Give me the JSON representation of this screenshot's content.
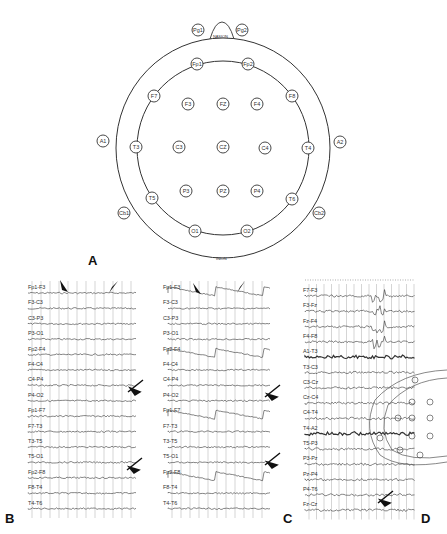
{
  "panel_a": {
    "label": "A",
    "nasion_label": "NASION",
    "inion_label": "INION",
    "electrodes": [
      {
        "name": "Pg1",
        "x": 198,
        "y": 30
      },
      {
        "name": "Pg2",
        "x": 242,
        "y": 30
      },
      {
        "name": "Fp1",
        "x": 197,
        "y": 64
      },
      {
        "name": "Fp2",
        "x": 248,
        "y": 64
      },
      {
        "name": "F7",
        "x": 154,
        "y": 96
      },
      {
        "name": "F3",
        "x": 188,
        "y": 104
      },
      {
        "name": "FZ",
        "x": 223,
        "y": 104
      },
      {
        "name": "F4",
        "x": 257,
        "y": 104
      },
      {
        "name": "F8",
        "x": 292,
        "y": 96
      },
      {
        "name": "A1",
        "x": 103,
        "y": 141
      },
      {
        "name": "T3",
        "x": 136,
        "y": 147
      },
      {
        "name": "C3",
        "x": 179,
        "y": 147
      },
      {
        "name": "CZ",
        "x": 223,
        "y": 147
      },
      {
        "name": "C4",
        "x": 265,
        "y": 148
      },
      {
        "name": "T4",
        "x": 308,
        "y": 148
      },
      {
        "name": "A2",
        "x": 340,
        "y": 142
      },
      {
        "name": "T5",
        "x": 152,
        "y": 198
      },
      {
        "name": "P3",
        "x": 186,
        "y": 191
      },
      {
        "name": "PZ",
        "x": 223,
        "y": 191
      },
      {
        "name": "P4",
        "x": 257,
        "y": 191
      },
      {
        "name": "T6",
        "x": 292,
        "y": 199
      },
      {
        "name": "Cb1",
        "x": 124,
        "y": 213
      },
      {
        "name": "Cb2",
        "x": 319,
        "y": 213
      },
      {
        "name": "O1",
        "x": 195,
        "y": 231
      },
      {
        "name": "O2",
        "x": 247,
        "y": 231
      }
    ]
  },
  "panel_b": {
    "label": "B",
    "channels": [
      "Fp1-F3",
      "F3-C3",
      "C3-P3",
      "P3-O1",
      "Fp2-F4",
      "F4-C4",
      "C4-P4",
      "P4-O2",
      "Fp1-F7",
      "F7-T3",
      "T3-T5",
      "T5-O1",
      "Fp2-F8",
      "F8-T4",
      "T4-T6"
    ]
  },
  "panel_c": {
    "label": "C",
    "channels": [
      "Fp1-F3",
      "F3-C3",
      "C3-P3",
      "P3-O1",
      "Fp2-F4",
      "F4-C4",
      "C4-P4",
      "P4-O2",
      "Fp1-F7",
      "F7-T3",
      "T3-T5",
      "T5-O1",
      "Fp2-F8",
      "F8-T4",
      "T4-T6"
    ]
  },
  "panel_d": {
    "label": "D",
    "channels": [
      "F7-F3",
      "F3-Fz",
      "Fz-F4",
      "F4-F8",
      "A1-T3",
      "T3-C3",
      "C3-Cz",
      "Cz-C4",
      "C4-T4",
      "T4-A2",
      "T5-P3",
      "P3-Pz",
      "Pz-P4",
      "P4-T6",
      "Fz-Cz"
    ]
  }
}
